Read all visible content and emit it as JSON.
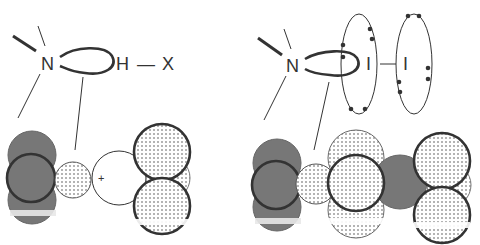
{
  "left_panel": {
    "atoms": {
      "nitrogen": "N",
      "hydrogen": "H",
      "bond": "—",
      "halogen": "X"
    },
    "cation_label": "+"
  },
  "right_panel": {
    "atoms": {
      "nitrogen": "N",
      "iodine_1": "I",
      "bond": "—",
      "iodine_2": "I"
    }
  },
  "colors": {
    "line": "#333333",
    "dark_fill": "#777777",
    "dot_fill": "#aaaaaa",
    "background": "#ffffff"
  }
}
